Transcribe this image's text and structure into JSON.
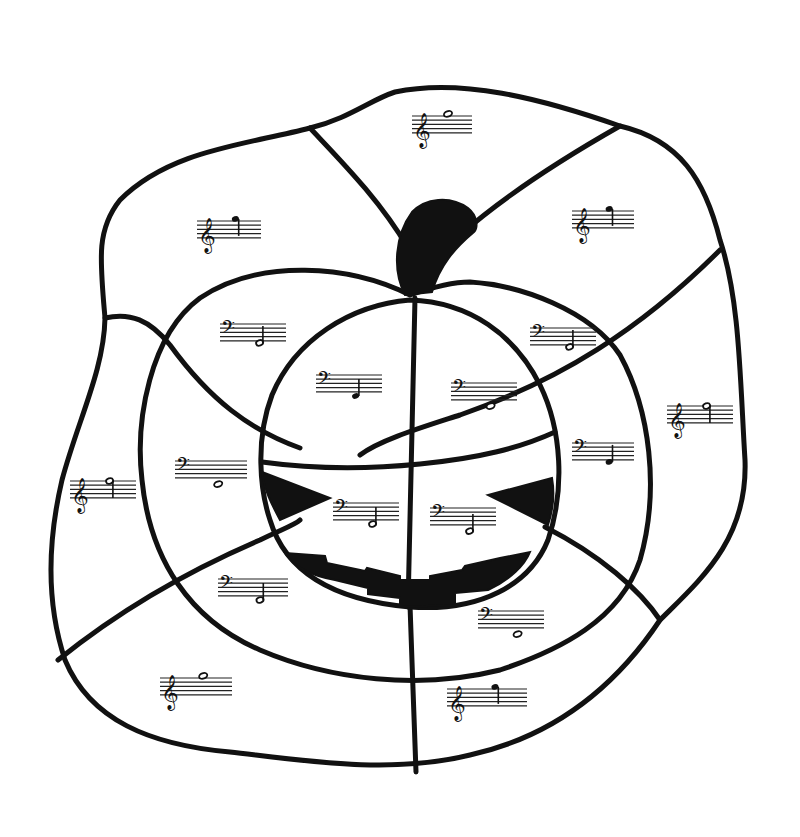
{
  "worksheet": {
    "title": "Color-by-note pumpkin",
    "ink_color": "#111111",
    "background": "#ffffff"
  },
  "icons": {
    "treble": "𝄞",
    "bass": "𝄢"
  },
  "staves": [
    {
      "id": "outer-top",
      "region": "outer",
      "clef": "treble",
      "x": 412,
      "y": 110,
      "w": 60,
      "note": "whole",
      "pos": 9
    },
    {
      "id": "outer-upper-left",
      "region": "outer",
      "clef": "treble",
      "x": 197,
      "y": 215,
      "w": 64,
      "note": "quarter",
      "pos": 9,
      "stem": "down"
    },
    {
      "id": "outer-upper-right",
      "region": "outer",
      "clef": "treble",
      "x": 572,
      "y": 205,
      "w": 62,
      "note": "quarter",
      "pos": 9,
      "stem": "down"
    },
    {
      "id": "middle-upper-left",
      "region": "middle",
      "clef": "bass",
      "x": 220,
      "y": 318,
      "w": 66,
      "note": "half",
      "pos": -1,
      "stem": "up"
    },
    {
      "id": "middle-upper-right",
      "region": "middle",
      "clef": "bass",
      "x": 530,
      "y": 322,
      "w": 66,
      "note": "half",
      "pos": -1,
      "stem": "up"
    },
    {
      "id": "inner-upper-left",
      "region": "inner",
      "clef": "bass",
      "x": 316,
      "y": 369,
      "w": 66,
      "note": "quarter",
      "pos": -2,
      "stem": "up"
    },
    {
      "id": "inner-upper-right",
      "region": "inner",
      "clef": "bass",
      "x": 451,
      "y": 377,
      "w": 66,
      "note": "whole",
      "pos": -3
    },
    {
      "id": "middle-right",
      "region": "middle",
      "clef": "bass",
      "x": 572,
      "y": 437,
      "w": 62,
      "note": "quarter",
      "pos": -1,
      "stem": "up"
    },
    {
      "id": "outer-right",
      "region": "outer",
      "clef": "treble",
      "x": 667,
      "y": 400,
      "w": 66,
      "note": "half",
      "pos": 8,
      "stem": "down"
    },
    {
      "id": "middle-left",
      "region": "middle",
      "clef": "bass",
      "x": 175,
      "y": 455,
      "w": 72,
      "note": "whole",
      "pos": -3
    },
    {
      "id": "outer-left",
      "region": "outer",
      "clef": "treble",
      "x": 70,
      "y": 475,
      "w": 66,
      "note": "half",
      "pos": 8,
      "stem": "down"
    },
    {
      "id": "inner-left-eye",
      "region": "inner",
      "clef": "bass",
      "x": 333,
      "y": 497,
      "w": 66,
      "note": "half",
      "pos": -2,
      "stem": "up"
    },
    {
      "id": "inner-right-eye",
      "region": "inner",
      "clef": "bass",
      "x": 430,
      "y": 502,
      "w": 66,
      "note": "half",
      "pos": -3,
      "stem": "up"
    },
    {
      "id": "middle-lower-left",
      "region": "middle",
      "clef": "bass",
      "x": 218,
      "y": 573,
      "w": 70,
      "note": "half",
      "pos": -2,
      "stem": "up"
    },
    {
      "id": "middle-lower-right",
      "region": "middle",
      "clef": "bass",
      "x": 478,
      "y": 605,
      "w": 66,
      "note": "whole",
      "pos": -3
    },
    {
      "id": "outer-lower-left",
      "region": "outer",
      "clef": "treble",
      "x": 160,
      "y": 672,
      "w": 72,
      "note": "whole",
      "pos": 9
    },
    {
      "id": "outer-lower-right",
      "region": "outer",
      "clef": "treble",
      "x": 447,
      "y": 683,
      "w": 80,
      "note": "quarter",
      "pos": 9,
      "stem": "down"
    }
  ]
}
